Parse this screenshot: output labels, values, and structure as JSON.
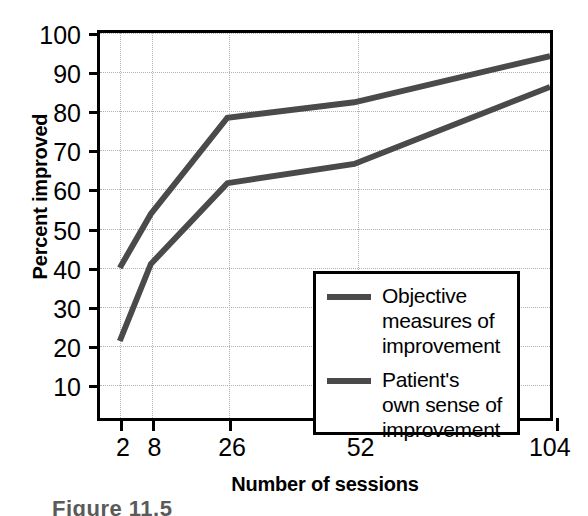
{
  "chart_data": {
    "type": "line",
    "title": "",
    "xlabel": "Number of sessions",
    "ylabel": "Percent improved",
    "x": [
      2,
      8,
      26,
      52,
      104
    ],
    "xtick_labels": [
      "2",
      "8",
      "26",
      "52",
      "104"
    ],
    "ytick_labels": [
      "10",
      "20",
      "30",
      "40",
      "50",
      "60",
      "70",
      "80",
      "90",
      "100"
    ],
    "yticks": [
      10,
      20,
      30,
      40,
      50,
      60,
      70,
      80,
      90,
      100
    ],
    "ylim": [
      0,
      100
    ],
    "grid": true,
    "legend_position": "lower-right-inside",
    "series": [
      {
        "name": "Objective measures of improvement",
        "values": [
          39,
          53,
          78,
          82,
          94
        ],
        "color": "#4a4a4a"
      },
      {
        "name": "Patient's own sense of improvement",
        "values": [
          20,
          40,
          61,
          66,
          86
        ],
        "color": "#4a4a4a"
      }
    ]
  },
  "legend": {
    "entries": [
      {
        "line1": "Objective",
        "line2": "measures of",
        "line3": "improvement"
      },
      {
        "line1": "Patient's",
        "line2": "own sense of",
        "line3": "improvement"
      }
    ]
  },
  "caption": {
    "text": "Figure  11.5"
  },
  "colors": {
    "line": "#4a4a4a",
    "axis": "#000000",
    "grid": "#b2b2b2",
    "background": "#ffffff"
  }
}
